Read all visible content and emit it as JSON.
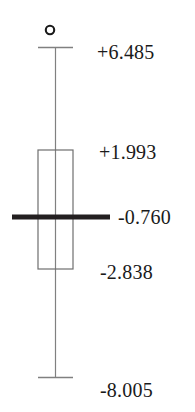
{
  "chart_data": {
    "type": "boxplot",
    "title": "",
    "xlabel": "",
    "ylabel": "",
    "orientation": "vertical",
    "grid": false,
    "legend": null,
    "axis_visible": false,
    "tick_labels_side": "right",
    "series": [
      {
        "name": "",
        "min": -8.005,
        "q1": -2.838,
        "median": -0.76,
        "q3": 1.993,
        "max": 6.485,
        "outliers": [
          {
            "marker": "o",
            "position": "above-upper-whisker"
          }
        ]
      }
    ],
    "labels": {
      "max": "+6.485",
      "q3": "+1.993",
      "median": "-0.760",
      "q1": "-2.838",
      "min": "-8.005"
    },
    "values": {
      "max": 6.485,
      "q3": 1.993,
      "median": -0.76,
      "q1": -2.838,
      "min": -8.005
    },
    "ylim": [
      -8.005,
      6.485
    ]
  },
  "plot": {
    "outlier_marker_glyph": "o",
    "colors": {
      "stroke": "#808080",
      "box_stroke": "#6e6e6e",
      "median_bar": "#231f20",
      "outlier": "#1a1a1a",
      "label_text": "#1a1a1a",
      "background": "#ffffff"
    },
    "geometry": {
      "center_x": 55,
      "box_left": 38,
      "box_right": 73,
      "box_top": 150,
      "box_bottom": 269,
      "cap_top_y": 47,
      "cap_bottom_y": 377,
      "median_y": 217,
      "median_bar_left": 12,
      "median_bar_right": 110,
      "median_bar_thickness": 5,
      "outlier_cx": 50,
      "outlier_cy": 30,
      "outlier_r": 4.2
    }
  }
}
